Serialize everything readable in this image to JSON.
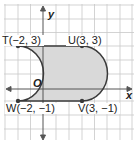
{
  "diagram": {
    "axes": {
      "x_label": "x",
      "y_label": "y",
      "origin_label": "O"
    },
    "points": [
      {
        "name": "T",
        "label": "T(−2, 3)",
        "x": -2,
        "y": 3
      },
      {
        "name": "U",
        "label": "U(3, 3)",
        "x": 3,
        "y": 3
      },
      {
        "name": "V",
        "label": "V(3, −1)",
        "x": 3,
        "y": -1
      },
      {
        "name": "W",
        "label": "W(−2, −1)",
        "x": -2,
        "y": -1
      }
    ],
    "colors": {
      "fill": "#d9d9d9",
      "stroke": "#3a3a3a",
      "grid": "#c8c8c8"
    }
  }
}
